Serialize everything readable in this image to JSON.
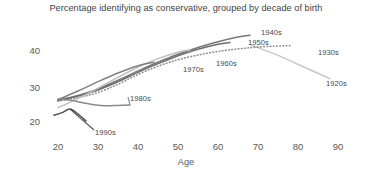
{
  "chart_data": {
    "type": "line",
    "title": "Percentage identifying as conservative, grouped by decade of birth",
    "xlabel": "Age",
    "ylabel": "",
    "xticks": [
      20,
      30,
      40,
      50,
      60,
      70,
      80,
      90
    ],
    "yticks": [
      20,
      30,
      40
    ],
    "xlim": [
      15,
      95
    ],
    "ylim": [
      15,
      46
    ],
    "grid": false,
    "legend_position": "inline-end-of-line",
    "series": [
      {
        "name": "1920s",
        "label": "1920s",
        "color": "#c8c8c8",
        "style": "solid",
        "x": [
          68,
          75,
          82,
          88
        ],
        "values": [
          41.5,
          38.5,
          35.0,
          32.0
        ]
      },
      {
        "name": "1930s",
        "label": "1930s",
        "color": "#8c8c8c",
        "style": "dotted",
        "x": [
          20,
          25,
          30,
          35,
          40,
          45,
          50,
          55,
          60,
          65,
          70,
          75,
          78
        ],
        "values": [
          25.8,
          26.8,
          28.2,
          30.5,
          33.2,
          35.5,
          37.3,
          38.6,
          39.6,
          40.3,
          40.8,
          41.1,
          41.2
        ]
      },
      {
        "name": "1940s",
        "label": "1940s",
        "color": "#777777",
        "style": "solid",
        "x": [
          20,
          25,
          30,
          35,
          40,
          45,
          50,
          55,
          60,
          65,
          68
        ],
        "values": [
          26.1,
          27.4,
          29.2,
          31.6,
          34.2,
          36.6,
          38.8,
          40.7,
          42.3,
          43.6,
          44.1
        ]
      },
      {
        "name": "1950s",
        "label": "1950s",
        "color": "#6e6e6e",
        "style": "solid",
        "x": [
          20,
          25,
          30,
          35,
          40,
          45,
          50,
          55,
          60,
          63
        ],
        "values": [
          26.0,
          27.2,
          28.9,
          31.2,
          33.8,
          36.2,
          38.4,
          40.2,
          41.6,
          42.1
        ]
      },
      {
        "name": "1960s",
        "label": "1960s",
        "color": "#bfbfbf",
        "style": "solid",
        "x": [
          20,
          25,
          30,
          35,
          40,
          45,
          50,
          53
        ],
        "values": [
          24.0,
          26.5,
          29.4,
          32.4,
          35.2,
          37.6,
          39.4,
          40.0
        ]
      },
      {
        "name": "1970s",
        "label": "1970s",
        "color": "#808080",
        "style": "solid",
        "x": [
          20,
          25,
          30,
          35,
          40,
          44
        ],
        "values": [
          26.2,
          28.6,
          31.2,
          33.6,
          35.6,
          36.6
        ]
      },
      {
        "name": "1980s",
        "label": "1980s",
        "color": "#8a8a8a",
        "style": "solid",
        "x": [
          20,
          23,
          26,
          29,
          32,
          35,
          38
        ],
        "values": [
          26.4,
          26.1,
          25.4,
          24.8,
          24.5,
          24.6,
          24.7
        ]
      },
      {
        "name": "1990s",
        "label": "1990s",
        "color": "#4d4d4d",
        "style": "solid",
        "x": [
          19,
          21,
          23,
          25,
          27
        ],
        "values": [
          21.9,
          22.6,
          23.6,
          22.2,
          20.3
        ]
      }
    ],
    "annotations": [
      {
        "text": "1940s",
        "x": 261,
        "y": 28
      },
      {
        "text": "1950s",
        "x": 248,
        "y": 38
      },
      {
        "text": "1930s",
        "x": 318,
        "y": 48
      },
      {
        "text": "1920s",
        "x": 326,
        "y": 79
      },
      {
        "text": "1960s",
        "x": 216,
        "y": 59
      },
      {
        "text": "1970s",
        "x": 183,
        "y": 65
      },
      {
        "text": "1980s",
        "x": 130,
        "y": 94
      },
      {
        "text": "1990s",
        "x": 95,
        "y": 128
      }
    ]
  }
}
